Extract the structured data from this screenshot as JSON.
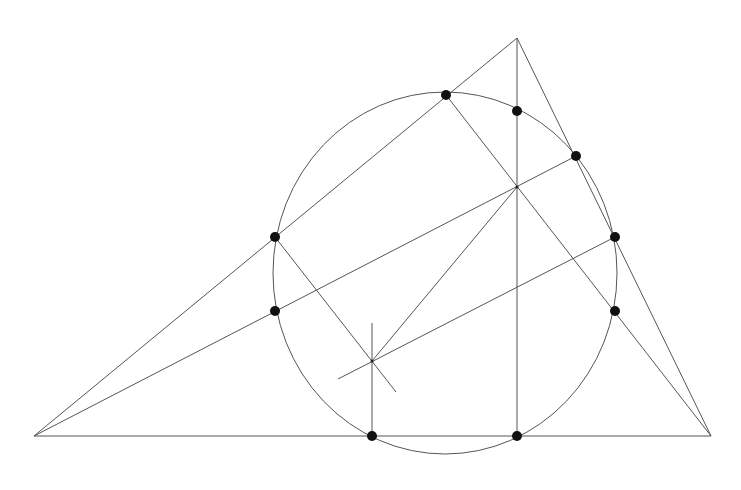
{
  "diagram": {
    "colors": {
      "line": "#555555",
      "dot": "#111111",
      "background": "#ffffff"
    },
    "vertices": {
      "A": [
        34,
        436
      ],
      "B": [
        711,
        436
      ],
      "C": [
        517,
        38
      ]
    },
    "orthocenter": [
      517,
      187
    ],
    "circumcenter": [
      372,
      361
    ],
    "nine_point_circle": {
      "cx": 445,
      "cy": 273,
      "rx": 172,
      "ry": 181
    },
    "points": [
      {
        "name": "foot-altitude-from-B",
        "xy": [
          446,
          95
        ]
      },
      {
        "name": "midpoint-CH",
        "xy": [
          517,
          111
        ]
      },
      {
        "name": "foot-altitude-from-A",
        "xy": [
          576,
          156
        ]
      },
      {
        "name": "midpoint-AC",
        "xy": [
          275,
          237
        ]
      },
      {
        "name": "midpoint-BC",
        "xy": [
          615,
          237
        ]
      },
      {
        "name": "midpoint-AH",
        "xy": [
          275,
          311
        ]
      },
      {
        "name": "midpoint-BH",
        "xy": [
          615,
          311
        ]
      },
      {
        "name": "midpoint-AB",
        "xy": [
          372,
          436
        ]
      },
      {
        "name": "foot-altitude-from-C",
        "xy": [
          517,
          436
        ]
      }
    ]
  }
}
